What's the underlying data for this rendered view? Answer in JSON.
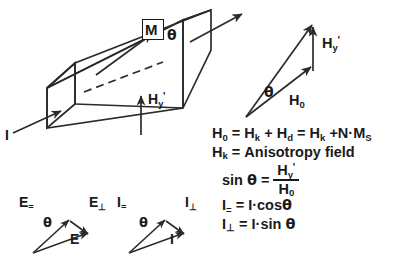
{
  "figure": {
    "stroke_color": "#2b2b2b",
    "text_color": "#1a1a1a",
    "background": "#ffffff"
  },
  "slab": {
    "magnetization_label": "M",
    "angle_label": "θ",
    "field_label_base": "H",
    "field_label_sub": "y",
    "field_label_prime": "'",
    "current_in_label": "I"
  },
  "h_triangle": {
    "angle_label": "θ",
    "base_label_base": "H",
    "base_label_sub": "0",
    "vertical_label_base": "H",
    "vertical_label_sub": "y",
    "vertical_label_prime": "'"
  },
  "e_triangle": {
    "parallel_label_base": "E",
    "parallel_label_sub": "=",
    "perpendicular_label_base": "E",
    "perpendicular_label_sub": "⊥",
    "resultant_label": "E",
    "angle_label": "θ"
  },
  "i_triangle": {
    "parallel_label_base": "I",
    "parallel_label_sub": "=",
    "perpendicular_label_base": "I",
    "perpendicular_label_sub": "⊥",
    "resultant_label": "I",
    "angle_label": "θ"
  },
  "equations": {
    "h0_line": {
      "lhs_base": "H",
      "lhs_sub": "0",
      "eq1": "=",
      "t1_base": "H",
      "t1_sub": "k",
      "plus1": "+",
      "t2_base": "H",
      "t2_sub": "d",
      "eq2": "=",
      "t3_base": "H",
      "t3_sub": "k",
      "plus2": "+",
      "t4": "N·M",
      "t4_sub": "S",
      "full_text": "H0 = Hk + Hd = Hk + N·MS"
    },
    "hk_line": {
      "lhs_base": "H",
      "lhs_sub": "k",
      "eq": "=",
      "rhs": "Anisotropy  field",
      "full_text": "Hk = Anisotropy field"
    },
    "sin_line": {
      "lhs": "sin",
      "lhs_theta": "θ",
      "eq": "=",
      "num_base": "H",
      "num_sub": "y",
      "num_prime": "'",
      "den_base": "H",
      "den_sub": "0",
      "full_text": "sin θ = Hy' / H0"
    },
    "i_par_line": {
      "lhs_base": "I",
      "lhs_sub": "=",
      "eq": "=",
      "rhs": "I·cos",
      "rhs_theta": "θ",
      "full_text": "I= = I·cosθ"
    },
    "i_perp_line": {
      "lhs_base": "I",
      "lhs_sub": "⊥",
      "eq": "=",
      "rhs": "I·sin",
      "rhs_theta": "θ",
      "full_text": "I⊥ = I·sin θ"
    }
  }
}
